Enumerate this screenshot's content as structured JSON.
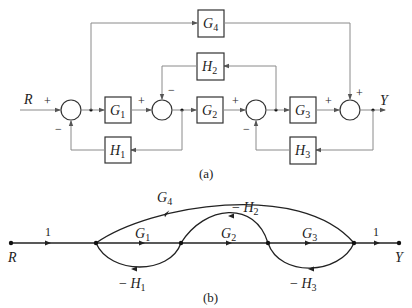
{
  "block_diagram": {
    "caption": "(a)",
    "input_label": "R",
    "output_label": "Y",
    "blocks": {
      "G1": {
        "base": "G",
        "sub": "1"
      },
      "G2": {
        "base": "G",
        "sub": "2"
      },
      "G3": {
        "base": "G",
        "sub": "3"
      },
      "G4": {
        "base": "G",
        "sub": "4"
      },
      "H1": {
        "base": "H",
        "sub": "1"
      },
      "H2": {
        "base": "H",
        "sub": "2"
      },
      "H3": {
        "base": "H",
        "sub": "3"
      }
    },
    "signs": {
      "sum1_in": "+",
      "sum1_fb": "−",
      "sum2_in": "+",
      "sum2_fb": "−",
      "sum3_in": "+",
      "sum3_fb": "−",
      "sum4_in": "+",
      "sum4_ff": "+"
    }
  },
  "signal_flow_graph": {
    "caption": "(b)",
    "input_label": "R",
    "output_label": "Y",
    "branches": {
      "in_gain": "1",
      "out_gain": "1",
      "G1": {
        "base": "G",
        "sub": "1"
      },
      "G2": {
        "base": "G",
        "sub": "2"
      },
      "G3": {
        "base": "G",
        "sub": "3"
      },
      "G4": {
        "base": "G",
        "sub": "4"
      },
      "H1": {
        "prefix": "− ",
        "base": "H",
        "sub": "1"
      },
      "H2": {
        "prefix": "− ",
        "base": "H",
        "sub": "2"
      },
      "H3": {
        "prefix": "− ",
        "base": "H",
        "sub": "3"
      }
    }
  }
}
